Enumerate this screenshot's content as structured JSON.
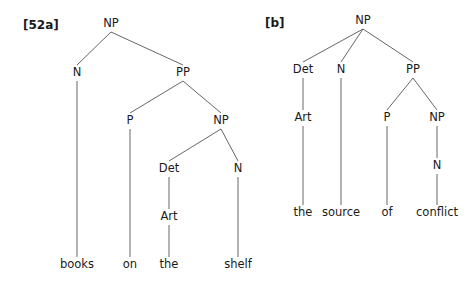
{
  "tree_a": {
    "label": "[52a]",
    "label_pos": [
      23,
      25
    ],
    "nodes": [
      {
        "id": "np1",
        "text": "NP",
        "x": 111,
        "y": 24
      },
      {
        "id": "n1",
        "text": "N",
        "x": 77,
        "y": 73
      },
      {
        "id": "pp1",
        "text": "PP",
        "x": 183,
        "y": 73
      },
      {
        "id": "p1",
        "text": "P",
        "x": 130,
        "y": 121
      },
      {
        "id": "np2",
        "text": "NP",
        "x": 221,
        "y": 121
      },
      {
        "id": "det1",
        "text": "Det",
        "x": 169,
        "y": 169
      },
      {
        "id": "n2",
        "text": "N",
        "x": 238,
        "y": 169
      },
      {
        "id": "art1",
        "text": "Art",
        "x": 169,
        "y": 217
      },
      {
        "id": "w1",
        "text": "books",
        "x": 77,
        "y": 265
      },
      {
        "id": "w2",
        "text": "on",
        "x": 130,
        "y": 265
      },
      {
        "id": "w3",
        "text": "the",
        "x": 169,
        "y": 265
      },
      {
        "id": "w4",
        "text": "shelf",
        "x": 238,
        "y": 265
      }
    ],
    "edges": [
      [
        "np1",
        "n1"
      ],
      [
        "np1",
        "pp1"
      ],
      [
        "n1",
        "w1"
      ],
      [
        "pp1",
        "p1"
      ],
      [
        "pp1",
        "np2"
      ],
      [
        "p1",
        "w2"
      ],
      [
        "np2",
        "det1"
      ],
      [
        "np2",
        "n2"
      ],
      [
        "det1",
        "art1"
      ],
      [
        "art1",
        "w3"
      ],
      [
        "n2",
        "w4"
      ]
    ]
  },
  "tree_b": {
    "label": "[b]",
    "label_pos": [
      265,
      23
    ],
    "nodes": [
      {
        "id": "np1",
        "text": "NP",
        "x": 363,
        "y": 21
      },
      {
        "id": "det1",
        "text": "Det",
        "x": 303,
        "y": 70
      },
      {
        "id": "n1",
        "text": "N",
        "x": 341,
        "y": 70
      },
      {
        "id": "pp1",
        "text": "PP",
        "x": 413,
        "y": 70
      },
      {
        "id": "art1",
        "text": "Art",
        "x": 303,
        "y": 118
      },
      {
        "id": "p1",
        "text": "P",
        "x": 387,
        "y": 118
      },
      {
        "id": "np2",
        "text": "NP",
        "x": 437,
        "y": 118
      },
      {
        "id": "n2",
        "text": "N",
        "x": 437,
        "y": 166
      },
      {
        "id": "w1",
        "text": "the",
        "x": 303,
        "y": 213
      },
      {
        "id": "w2",
        "text": "source",
        "x": 341,
        "y": 213
      },
      {
        "id": "w3",
        "text": "of",
        "x": 387,
        "y": 213
      },
      {
        "id": "w4",
        "text": "conflict",
        "x": 437,
        "y": 213
      }
    ],
    "edges": [
      [
        "np1",
        "det1"
      ],
      [
        "np1",
        "n1"
      ],
      [
        "np1",
        "pp1"
      ],
      [
        "det1",
        "art1"
      ],
      [
        "art1",
        "w1"
      ],
      [
        "n1",
        "w2"
      ],
      [
        "pp1",
        "p1"
      ],
      [
        "pp1",
        "np2"
      ],
      [
        "p1",
        "w3"
      ],
      [
        "np2",
        "n2"
      ],
      [
        "n2",
        "w4"
      ]
    ]
  }
}
